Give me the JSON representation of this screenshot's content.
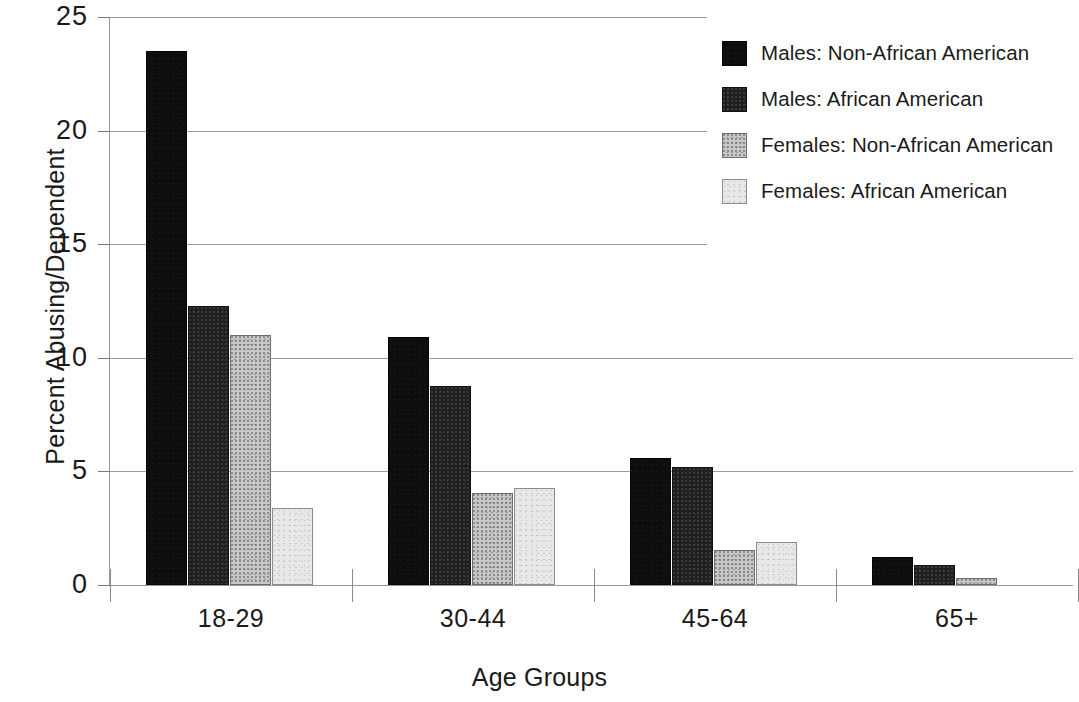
{
  "chart_data": {
    "type": "bar",
    "title": "",
    "xlabel": "Age Groups",
    "ylabel": "Percent Abusing/Dependent",
    "categories": [
      "18-29",
      "30-44",
      "45-64",
      "65+"
    ],
    "ylim": [
      0,
      25
    ],
    "yticks": [
      0,
      5,
      10,
      15,
      20,
      25
    ],
    "ytick_labels": [
      "0",
      "5",
      "10",
      "15",
      "20",
      "25"
    ],
    "grid": true,
    "legend_position": "top-right",
    "series": [
      {
        "name": "Males: Non-African American",
        "color": "#0d0d0d",
        "values": [
          23.5,
          10.9,
          5.6,
          1.25
        ]
      },
      {
        "name": "Males: African American",
        "color": "#1f1f1f",
        "values": [
          12.3,
          8.75,
          5.2,
          0.9
        ]
      },
      {
        "name": "Females: Non-African American",
        "color": "#c8c8c8",
        "values": [
          11.0,
          4.05,
          1.55,
          0.3
        ]
      },
      {
        "name": "Females: African American",
        "color": "#e8e8e8",
        "values": [
          3.4,
          4.25,
          1.9,
          0.0
        ]
      }
    ]
  }
}
